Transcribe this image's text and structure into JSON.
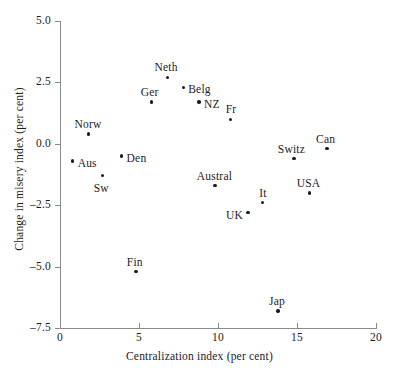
{
  "chart_data": {
    "type": "scatter",
    "title": "",
    "xlabel": "Centralization index (per cent)",
    "ylabel": "Change in misery index (per cent)",
    "xlim": [
      0,
      20
    ],
    "ylim": [
      -7.5,
      5.0
    ],
    "xticks": [
      "0",
      "5",
      "10",
      "15",
      "20"
    ],
    "xtick_values": [
      0,
      5,
      10,
      15,
      20
    ],
    "yticks": [
      "5.0",
      "2.5",
      "0.0",
      "–2.5",
      "–5.0",
      "–7.5"
    ],
    "ytick_values": [
      5.0,
      2.5,
      0.0,
      -2.5,
      -5.0,
      -7.5
    ],
    "grid": false,
    "legend": "none",
    "marker_color": "#1b1b1b",
    "axis_color": "#8a8a8a",
    "points": [
      {
        "label": "Aus",
        "x": 0.8,
        "y": -0.7,
        "lx": 5,
        "ly": -4
      },
      {
        "label": "Norw",
        "x": 1.8,
        "y": 0.4,
        "lx": -14,
        "ly": -16
      },
      {
        "label": "Sw",
        "x": 2.7,
        "y": -1.3,
        "lx": -9,
        "ly": 6
      },
      {
        "label": "Den",
        "x": 3.9,
        "y": -0.5,
        "lx": 5,
        "ly": -4
      },
      {
        "label": "Fin",
        "x": 4.8,
        "y": -5.2,
        "lx": -9,
        "ly": -16
      },
      {
        "label": "Ger",
        "x": 5.8,
        "y": 1.7,
        "lx": -11,
        "ly": -16
      },
      {
        "label": "Neth",
        "x": 6.8,
        "y": 2.7,
        "lx": -13,
        "ly": -16
      },
      {
        "label": "Belg",
        "x": 7.8,
        "y": 2.3,
        "lx": 5,
        "ly": -4
      },
      {
        "label": "NZ",
        "x": 8.8,
        "y": 1.7,
        "lx": 5,
        "ly": -4
      },
      {
        "label": "Austral",
        "x": 9.8,
        "y": -1.7,
        "lx": -18,
        "ly": -16
      },
      {
        "label": "Fr",
        "x": 10.8,
        "y": 1.0,
        "lx": -5,
        "ly": -16
      },
      {
        "label": "UK",
        "x": 11.9,
        "y": -2.8,
        "lx": -22,
        "ly": -4
      },
      {
        "label": "It",
        "x": 12.8,
        "y": -2.4,
        "lx": -3,
        "ly": -16
      },
      {
        "label": "Jap",
        "x": 13.8,
        "y": -6.8,
        "lx": -9,
        "ly": -16
      },
      {
        "label": "Switz",
        "x": 14.8,
        "y": -0.6,
        "lx": -16,
        "ly": -16
      },
      {
        "label": "USA",
        "x": 15.8,
        "y": -2.0,
        "lx": -13,
        "ly": -16
      },
      {
        "label": "Can",
        "x": 16.9,
        "y": -0.2,
        "lx": -11,
        "ly": -16
      }
    ]
  }
}
